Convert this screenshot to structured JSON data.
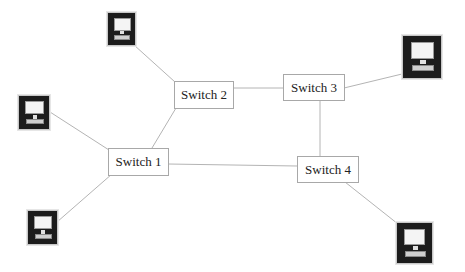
{
  "diagram": {
    "type": "network-topology",
    "switches": [
      {
        "id": "sw1",
        "label": "Switch 1",
        "x": 108,
        "y": 148,
        "w": 61,
        "h": 28
      },
      {
        "id": "sw2",
        "label": "Switch 2",
        "x": 174,
        "y": 81,
        "w": 60,
        "h": 28
      },
      {
        "id": "sw3",
        "label": "Switch 3",
        "x": 283,
        "y": 74,
        "w": 62,
        "h": 27
      },
      {
        "id": "sw4",
        "label": "Switch 4",
        "x": 297,
        "y": 156,
        "w": 62,
        "h": 27
      }
    ],
    "computers": [
      {
        "id": "pc-top",
        "icon": "computer-icon",
        "x": 107,
        "y": 12,
        "w": 29,
        "h": 34,
        "connects_to": "sw2"
      },
      {
        "id": "pc-left",
        "icon": "computer-icon",
        "x": 18,
        "y": 95,
        "w": 32,
        "h": 35,
        "connects_to": "sw1"
      },
      {
        "id": "pc-bottom-left",
        "icon": "computer-icon",
        "x": 27,
        "y": 210,
        "w": 31,
        "h": 35,
        "connects_to": "sw1"
      },
      {
        "id": "pc-top-right",
        "icon": "computer-icon",
        "x": 402,
        "y": 35,
        "w": 40,
        "h": 44,
        "connects_to": "sw3"
      },
      {
        "id": "pc-bottom-right",
        "icon": "computer-icon",
        "x": 396,
        "y": 222,
        "w": 37,
        "h": 42,
        "connects_to": "sw4"
      }
    ],
    "links": [
      {
        "from": "pc-top",
        "to": "sw2",
        "x1": 134,
        "y1": 45,
        "x2": 175,
        "y2": 82
      },
      {
        "from": "pc-left",
        "to": "sw1",
        "x1": 50,
        "y1": 112,
        "x2": 109,
        "y2": 150
      },
      {
        "from": "pc-bottom-left",
        "to": "sw1",
        "x1": 57,
        "y1": 222,
        "x2": 112,
        "y2": 174
      },
      {
        "from": "sw2",
        "to": "sw1",
        "x1": 176,
        "y1": 108,
        "x2": 152,
        "y2": 148
      },
      {
        "from": "sw2",
        "to": "sw3",
        "x1": 233,
        "y1": 88,
        "x2": 283,
        "y2": 88
      },
      {
        "from": "sw3",
        "to": "pc-top-right",
        "x1": 344,
        "y1": 88,
        "x2": 402,
        "y2": 74
      },
      {
        "from": "sw3",
        "to": "sw4",
        "x1": 320,
        "y1": 100,
        "x2": 320,
        "y2": 157
      },
      {
        "from": "sw1",
        "to": "sw4",
        "x1": 168,
        "y1": 164,
        "x2": 297,
        "y2": 166
      },
      {
        "from": "sw4",
        "to": "pc-bottom-right",
        "x1": 345,
        "y1": 182,
        "x2": 398,
        "y2": 224
      }
    ],
    "colors": {
      "link": "#b4b4b4",
      "switch_border": "#a8a8a8",
      "computer_frame": "#1c1c1c"
    }
  }
}
